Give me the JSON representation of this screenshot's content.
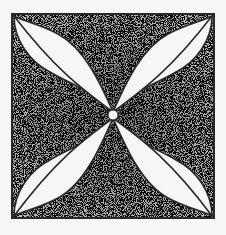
{
  "figure": {
    "colors": {
      "background": "#f7f7f7",
      "border": "#2a2a2a",
      "stipple_dark": "#3a3a3a",
      "stipple_light": "#ffffff",
      "petal": "#f5f5f5"
    }
  }
}
